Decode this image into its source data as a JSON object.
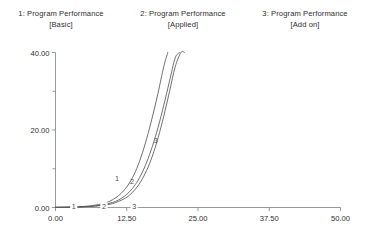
{
  "legend": {
    "entries": [
      {
        "title": "1: Program Performance",
        "subtitle": "[Basic]"
      },
      {
        "title": "2: Program Performance",
        "subtitle": "[Applied]"
      },
      {
        "title": "3: Program Performance",
        "subtitle": "[Add on]"
      }
    ]
  },
  "chart_data": {
    "type": "line",
    "title": "",
    "subtitle": "",
    "xlabel": "",
    "ylabel": "",
    "xlim": [
      0,
      50
    ],
    "ylim": [
      0,
      40
    ],
    "grid": false,
    "legend_position": "top",
    "x_ticks": [
      "0.00",
      "12.50",
      "25.00",
      "37.50",
      "50.00"
    ],
    "x_tick_values": [
      0,
      12.5,
      25,
      37.5,
      50
    ],
    "y_ticks": [
      "0.00",
      "20.00",
      "40.00"
    ],
    "y_tick_values": [
      0,
      20,
      40
    ],
    "y_minor_tick_values": [
      10,
      30
    ],
    "series": [
      {
        "name": "1: Program Performance [Basic]",
        "label": "1",
        "label_at": {
          "x": 10.8,
          "y": 6.9
        },
        "color": "#555555",
        "x": [
          0,
          2,
          4,
          6,
          8,
          9,
          10,
          11,
          12,
          13,
          14,
          15,
          16,
          17,
          18,
          19,
          19.7
        ],
        "y": [
          0.05,
          0.1,
          0.2,
          0.4,
          0.9,
          1.3,
          2.0,
          3.0,
          4.4,
          6.4,
          9.2,
          13.0,
          17.8,
          23.4,
          29.6,
          36.4,
          40.0
        ]
      },
      {
        "name": "2: Program Performance [Applied]",
        "label": "2",
        "label_at": {
          "x": 13.4,
          "y": 6.1
        },
        "color": "#555555",
        "x": [
          0,
          2,
          4,
          6,
          8,
          10,
          11,
          12,
          13,
          14,
          15,
          16,
          17,
          18,
          19,
          20,
          21,
          21.8
        ],
        "y": [
          0.05,
          0.08,
          0.15,
          0.3,
          0.6,
          1.3,
          1.9,
          2.8,
          4.1,
          5.9,
          8.4,
          11.7,
          15.8,
          20.7,
          26.4,
          32.6,
          38.6,
          40.0
        ]
      },
      {
        "name": "3: Program Performance [Add on]",
        "label": "3",
        "label_at": {
          "x": 17.6,
          "y": 16.7
        },
        "color": "#555555",
        "x": [
          0,
          2,
          4,
          6,
          8,
          10,
          12,
          13,
          14,
          15,
          16,
          17,
          18,
          19,
          20,
          21,
          22,
          22.6
        ],
        "y": [
          0.05,
          0.07,
          0.12,
          0.25,
          0.5,
          1.0,
          2.2,
          3.2,
          4.7,
          6.8,
          9.6,
          13.3,
          18.0,
          23.6,
          29.9,
          36.3,
          40.0,
          40.0
        ]
      }
    ],
    "inline_markers": [
      {
        "label": "1",
        "x": 3.2,
        "y": 0.2
      },
      {
        "label": "2",
        "x": 8.5,
        "y": 0.2
      },
      {
        "label": "3",
        "x": 13.8,
        "y": 0.2
      }
    ]
  }
}
